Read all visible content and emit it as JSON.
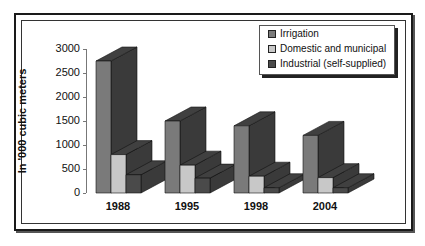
{
  "chart_data": {
    "type": "bar",
    "subtype": "3d-clustered",
    "title": "",
    "xlabel": "",
    "ylabel": "In '000 cubic meters",
    "ylim": [
      0,
      3000
    ],
    "yticks": [
      "0",
      "500",
      "1000",
      "1500",
      "2000",
      "2500",
      "3000"
    ],
    "categories": [
      "1988",
      "1995",
      "1998",
      "2004"
    ],
    "series": [
      {
        "name": "Irrigation",
        "color": "#7a7a7a",
        "values": [
          2750,
          1500,
          1400,
          1200
        ]
      },
      {
        "name": "Domestic and municipal",
        "color": "#c8c8c8",
        "values": [
          800,
          580,
          350,
          320
        ]
      },
      {
        "name": "Industrial (self-supplied)",
        "color": "#4a4a4a",
        "values": [
          380,
          310,
          110,
          110
        ]
      }
    ],
    "legend_position": "top-right",
    "grid": false
  }
}
